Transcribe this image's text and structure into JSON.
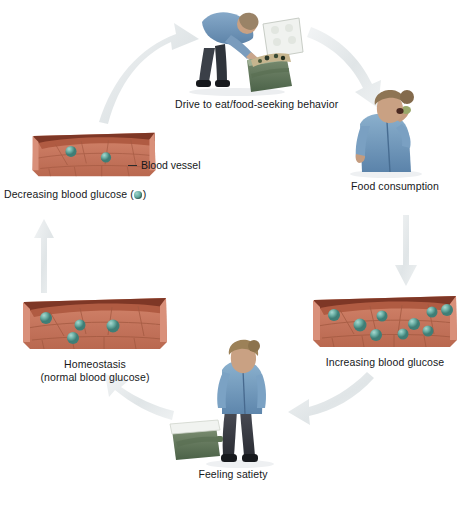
{
  "diagram": {
    "type": "cycle",
    "background_color": "#ffffff",
    "arrow_color": "#e3e7e8",
    "glucose_color": "#63aca2",
    "vessel_color": "#c9775e",
    "vessel_top_color": "#8e3f2c",
    "shirt_color": "#6f97bd"
  },
  "stages": [
    {
      "id": "drive-to-eat",
      "label": "Drive to eat/food-seeking behavior",
      "illustration": "person-bending-over-open-cooler",
      "position": "top"
    },
    {
      "id": "food-consumption",
      "label": "Food consumption",
      "illustration": "person-eating",
      "position": "right-top"
    },
    {
      "id": "increasing-blood-glucose",
      "label": "Increasing blood glucose",
      "illustration": "blood-vessel-cross-section",
      "glucose_count": 9,
      "position": "right-bottom"
    },
    {
      "id": "feeling-satiety",
      "label": "Feeling satiety",
      "illustration": "person-standing-with-closed-cooler",
      "position": "bottom"
    },
    {
      "id": "homeostasis",
      "label_line1": "Homeostasis",
      "label_line2": "(normal blood glucose)",
      "illustration": "blood-vessel-cross-section",
      "glucose_count": 4,
      "position": "left-bottom"
    },
    {
      "id": "decreasing-blood-glucose",
      "label_prefix": "Decreasing blood glucose (",
      "label_suffix": ")",
      "illustration": "blood-vessel-cross-section",
      "glucose_count": 2,
      "position": "left-top"
    }
  ],
  "callouts": [
    {
      "id": "blood-vessel",
      "label": "Blood vessel",
      "target": "decreasing-blood-glucose"
    }
  ],
  "arrows": [
    {
      "id": "homeostasis-to-decreasing",
      "from": "homeostasis",
      "to": "decreasing-blood-glucose",
      "shape": "straight-up"
    },
    {
      "id": "decreasing-to-drive",
      "from": "decreasing-blood-glucose",
      "to": "drive-to-eat",
      "shape": "curve-up-right"
    },
    {
      "id": "drive-to-food",
      "from": "drive-to-eat",
      "to": "food-consumption",
      "shape": "curve-down-right"
    },
    {
      "id": "food-to-increasing",
      "from": "food-consumption",
      "to": "increasing-blood-glucose",
      "shape": "straight-down"
    },
    {
      "id": "increasing-to-satiety",
      "from": "increasing-blood-glucose",
      "to": "feeling-satiety",
      "shape": "curve-down-left"
    },
    {
      "id": "satiety-to-homeostasis",
      "from": "feeling-satiety",
      "to": "homeostasis",
      "shape": "curve-up-left"
    }
  ]
}
